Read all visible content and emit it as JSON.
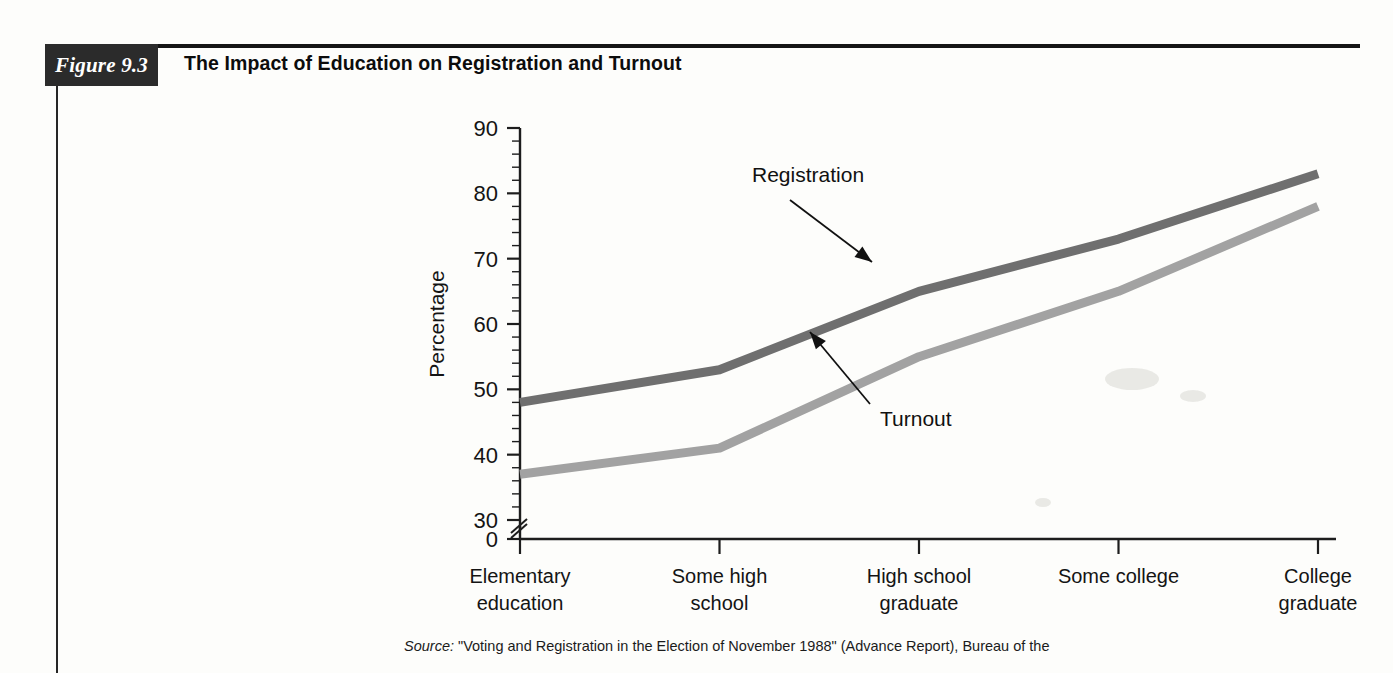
{
  "figure": {
    "tag": "Figure 9.3",
    "title": "The Impact of Education on Registration and Turnout"
  },
  "source": {
    "label": "Source:",
    "text": " \"Voting and Registration in the Election of November 1988\" (Advance Report), Bureau of the"
  },
  "chart_data": {
    "type": "line",
    "title": "The Impact of Education on Registration and Turnout",
    "xlabel": "",
    "ylabel": "Percentage",
    "ylim": [
      30,
      90
    ],
    "yticks": [
      30,
      40,
      50,
      60,
      70,
      80,
      90
    ],
    "ytick_labels": [
      "30",
      "40",
      "50",
      "60",
      "70",
      "80",
      "90"
    ],
    "y_axis_break": true,
    "y_axis_break_label": "0",
    "y_minor_tick_step": 2,
    "grid": false,
    "legend": "annotated-inline",
    "categories": [
      "Elementary education",
      "Some high school",
      "High school graduate",
      "Some college",
      "College graduate"
    ],
    "category_lines": [
      [
        "Elementary",
        "education"
      ],
      [
        "Some high",
        "school"
      ],
      [
        "High school",
        "graduate"
      ],
      [
        "Some college",
        ""
      ],
      [
        "College",
        "graduate"
      ]
    ],
    "series": [
      {
        "name": "Registration",
        "color": "#6f6f6f",
        "values": [
          48,
          53,
          65,
          73,
          83
        ]
      },
      {
        "name": "Turnout",
        "color": "#a2a2a2",
        "values": [
          37,
          41,
          55,
          65,
          78
        ]
      }
    ],
    "annotations": [
      {
        "text": "Registration",
        "target_series": "Registration",
        "target_category": "High school graduate"
      },
      {
        "text": "Turnout",
        "target_series": "Turnout",
        "target_category": "High school graduate"
      }
    ]
  }
}
